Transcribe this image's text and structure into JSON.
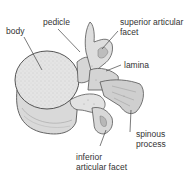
{
  "diagram": {
    "labels": {
      "body": "body",
      "pedicle": "pedicle",
      "superior_facet_line1": "superior articular",
      "superior_facet_line2": "facet",
      "lamina": "lamina",
      "spinous_line1": "spinous",
      "spinous_line2": "process",
      "inferior_facet_line1": "inferior",
      "inferior_facet_line2": "articular facet"
    },
    "colors": {
      "bone_fill": "#e6e6e6",
      "bone_shade": "#bdbdbd",
      "outline": "#555555",
      "leader": "#444444",
      "text": "#333333"
    }
  }
}
